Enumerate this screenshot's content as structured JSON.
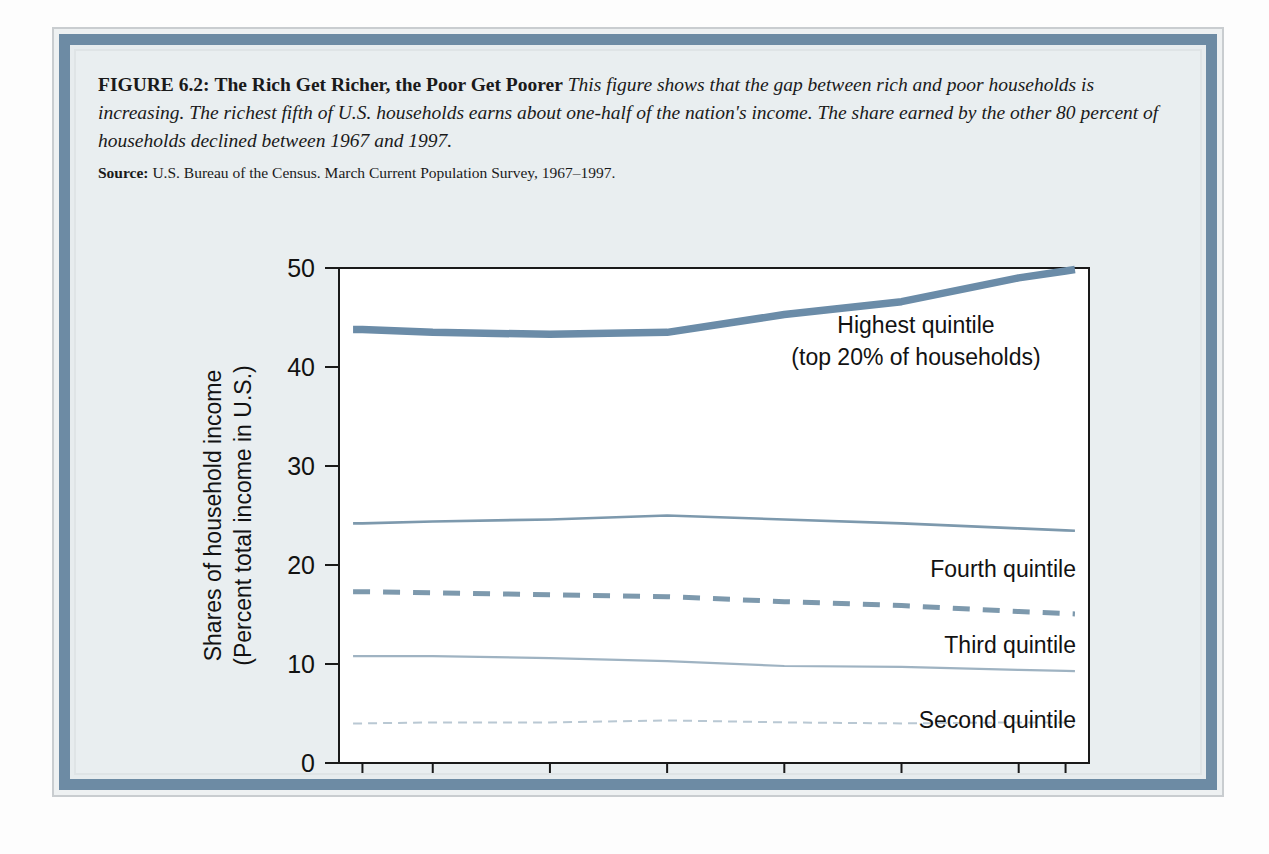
{
  "figure": {
    "label": "FIGURE 6.2:",
    "title": "The Rich Get Richer, the Poor Get Poorer",
    "description": "This figure shows that the gap between rich and poor households is increasing. The richest fifth of U.S. households earns about one-half of the nation's income. The share earned by the other 80 percent of households declined between 1967 and 1997.",
    "source_word": "Source:",
    "source_text": "U.S. Bureau of the Census. March Current Population Survey, 1967–1997."
  },
  "colors": {
    "line_primary": "#6b8ca8",
    "line_secondary": "#7d99ad",
    "line_light": "#9fb3c2",
    "line_faint": "#b9c8d3",
    "frame_band": "#6d8ba4",
    "page_bg": "#e9eef0",
    "plot_bg": "#ffffff",
    "axis": "#1a1a1a"
  },
  "chart_data": {
    "type": "line",
    "title": "",
    "xlabel": "Year",
    "ylabel": "Shares of household income (Percent total income in U.S.)",
    "ylabel_line1": "Shares of household income",
    "ylabel_line2": "(Percent total income in U.S.)",
    "xlim": [
      1966,
      1998
    ],
    "ylim": [
      0,
      50
    ],
    "yticks": [
      0,
      10,
      20,
      30,
      40,
      50
    ],
    "ytick_labels": [
      "0",
      "10",
      "20",
      "30",
      "40",
      "50"
    ],
    "xticks": [
      1967,
      1970,
      1975,
      1980,
      1985,
      1990,
      1995,
      1997
    ],
    "xtick_labels": [
      "1967",
      "1970",
      "1975",
      "1980",
      "1985",
      "1990",
      "1995",
      "1997"
    ],
    "grid": false,
    "legend_position": "inline-right",
    "x": [
      1967,
      1970,
      1975,
      1980,
      1985,
      1990,
      1995,
      1997
    ],
    "series": [
      {
        "name": "Highest quintile",
        "label_line1": "Highest quintile",
        "label_line2": "(top 20% of households)",
        "style": "solid-thick",
        "color": "#6b8ca8",
        "values": [
          43.8,
          43.5,
          43.3,
          43.5,
          45.3,
          46.6,
          49.0,
          49.7
        ]
      },
      {
        "name": "Fourth quintile",
        "label_line1": "Fourth quintile",
        "label_line2": "",
        "style": "solid-thin",
        "color": "#7d99ad",
        "values": [
          24.2,
          24.4,
          24.6,
          25.0,
          24.6,
          24.2,
          23.7,
          23.5
        ]
      },
      {
        "name": "Third quintile",
        "label_line1": "Third quintile",
        "label_line2": "",
        "style": "dashed",
        "color": "#7d99ad",
        "values": [
          17.3,
          17.2,
          17.0,
          16.8,
          16.3,
          15.9,
          15.3,
          15.1
        ]
      },
      {
        "name": "Second quintile",
        "label_line1": "Second quintile",
        "label_line2": "",
        "style": "solid-light",
        "color": "#9fb3c2",
        "values": [
          10.8,
          10.8,
          10.6,
          10.3,
          9.8,
          9.7,
          9.4,
          9.3
        ]
      },
      {
        "name": "Lowest quintile",
        "label_line1": "Lowest quintile",
        "label_line2": "",
        "style": "dotted",
        "color": "#b9c8d3",
        "values": [
          4.0,
          4.1,
          4.1,
          4.3,
          4.1,
          4.0,
          4.1,
          4.1
        ]
      }
    ]
  }
}
